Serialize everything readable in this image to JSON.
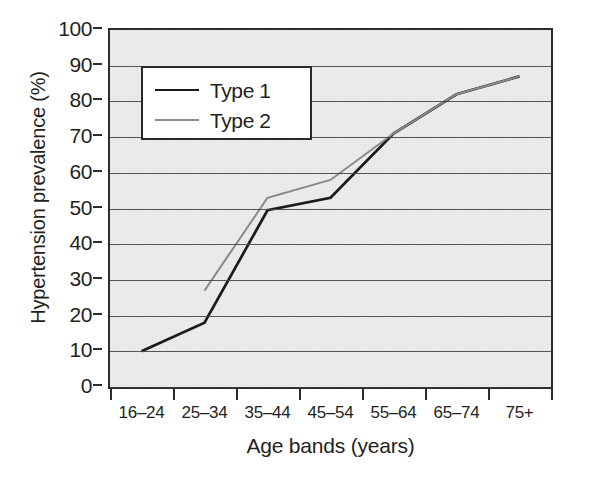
{
  "chart_data": {
    "type": "line",
    "title": "",
    "xlabel": "Age bands (years)",
    "ylabel": "Hypertension prevalence (%)",
    "categories": [
      "16–24",
      "25–34",
      "35–44",
      "45–54",
      "55–64",
      "65–74",
      "75+"
    ],
    "ylim": [
      0,
      100
    ],
    "ytick_step": 10,
    "yticks": [
      "0",
      "10",
      "20",
      "30",
      "40",
      "50",
      "60",
      "70",
      "80",
      "90",
      "100"
    ],
    "grid": true,
    "legend_position": "upper-left-inside",
    "series": [
      {
        "name": "Type 1",
        "color": "#1d1a1b",
        "values": [
          10,
          18,
          49.5,
          53,
          71,
          82,
          87
        ]
      },
      {
        "name": "Type 2",
        "color": "#8d8a8b",
        "values": [
          null,
          27,
          53,
          58,
          71,
          82,
          87
        ]
      }
    ]
  },
  "axes": {
    "y": {
      "title": "Hypertension prevalence (%)",
      "ticks": [
        "100",
        "90",
        "80",
        "70",
        "60",
        "50",
        "40",
        "30",
        "20",
        "10",
        "0"
      ]
    },
    "x": {
      "title": "Age bands (years)",
      "ticks": [
        "16–24",
        "25–34",
        "35–44",
        "45–54",
        "55–64",
        "65–74",
        "75+"
      ]
    }
  },
  "legend": {
    "entries": [
      {
        "label": "Type 1",
        "swatch": "solid-dark-line"
      },
      {
        "label": "Type 2",
        "swatch": "solid-gray-line"
      }
    ]
  },
  "colors": {
    "plot_background": "#ededed",
    "axis": "#2e2b2c",
    "gridline": "#4a4748",
    "series_type1": "#1d1a1b",
    "series_type2": "#8d8a8b",
    "legend_background": "#ffffff"
  }
}
